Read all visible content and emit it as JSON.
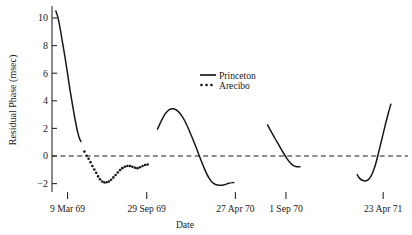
{
  "chart_data": {
    "type": "line",
    "title": "",
    "xlabel": "Date",
    "ylabel": "Residual Phase (msec)",
    "ylim": [
      -3.0,
      11.2
    ],
    "xlim": [
      0,
      100
    ],
    "grid": false,
    "legend_position": "upper-center-right",
    "y_ticks": [
      -2,
      0,
      2,
      4,
      6,
      8,
      10
    ],
    "y_tick_labels": [
      "−2",
      "0",
      "2",
      "4",
      "6",
      "8",
      "10"
    ],
    "x_ticks": [
      4.9,
      29.8,
      57.7,
      73.6,
      104.2
    ],
    "x_tick_labels": [
      "9 Mar 69",
      "29 Sep 69",
      "27 Apr 70",
      "1 Sep 70",
      "23 Apr 71"
    ],
    "zero_reference_line": {
      "value": 0,
      "style": "dashed"
    },
    "series": [
      {
        "name": "Princeton",
        "style": "solid",
        "segments": [
          {
            "comment": "segment 1 - steep fall from 10.5 to 1.0",
            "points": [
              [
                1.2,
                10.5
              ],
              [
                1.8,
                10.1
              ],
              [
                2.6,
                9.2
              ],
              [
                3.4,
                8.1
              ],
              [
                4.2,
                7.0
              ],
              [
                5.0,
                5.8
              ],
              [
                5.8,
                4.6
              ],
              [
                6.6,
                3.5
              ],
              [
                7.3,
                2.6
              ],
              [
                8.0,
                1.8
              ],
              [
                8.6,
                1.3
              ],
              [
                9.1,
                1.05
              ]
            ]
          },
          {
            "comment": "segment 2 - hump peaking at 3.4 then trough at -2.1",
            "points": [
              [
                33.2,
                1.95
              ],
              [
                34.4,
                2.55
              ],
              [
                35.6,
                3.05
              ],
              [
                36.8,
                3.35
              ],
              [
                38.2,
                3.42
              ],
              [
                39.6,
                3.25
              ],
              [
                41.0,
                2.85
              ],
              [
                42.4,
                2.25
              ],
              [
                43.8,
                1.5
              ],
              [
                45.2,
                0.7
              ],
              [
                46.6,
                -0.15
              ],
              [
                48.0,
                -0.95
              ],
              [
                49.4,
                -1.6
              ],
              [
                50.8,
                -1.98
              ],
              [
                52.4,
                -2.12
              ],
              [
                54.0,
                -2.1
              ],
              [
                55.6,
                -1.98
              ],
              [
                57.2,
                -1.92
              ]
            ]
          },
          {
            "comment": "segment 3 - descent from 2.2 crossing zero to -0.5",
            "points": [
              [
                67.8,
                2.25
              ],
              [
                69.0,
                1.75
              ],
              [
                70.2,
                1.25
              ],
              [
                71.4,
                0.78
              ],
              [
                72.6,
                0.3
              ],
              [
                73.8,
                -0.15
              ],
              [
                75.0,
                -0.5
              ],
              [
                76.0,
                -0.7
              ],
              [
                77.0,
                -0.78
              ],
              [
                78.0,
                -0.78
              ]
            ]
          },
          {
            "comment": "segment 4 - trough at -1.75 then steep rise to 3.8",
            "points": [
              [
                96.0,
                -1.35
              ],
              [
                96.8,
                -1.62
              ],
              [
                97.8,
                -1.78
              ],
              [
                98.8,
                -1.8
              ],
              [
                99.8,
                -1.65
              ],
              [
                100.8,
                -1.25
              ],
              [
                101.8,
                -0.6
              ],
              [
                102.8,
                0.3
              ],
              [
                103.8,
                1.25
              ],
              [
                104.8,
                2.2
              ],
              [
                105.8,
                3.1
              ],
              [
                106.6,
                3.75
              ]
            ]
          }
        ]
      },
      {
        "name": "Arecibo",
        "style": "dotted",
        "points": [
          [
            10.2,
            0.32
          ],
          [
            10.9,
            0.02
          ],
          [
            11.5,
            -0.2
          ],
          [
            12.1,
            -0.45
          ],
          [
            12.7,
            -0.72
          ],
          [
            13.3,
            -0.98
          ],
          [
            13.9,
            -1.22
          ],
          [
            14.5,
            -1.48
          ],
          [
            15.1,
            -1.68
          ],
          [
            15.8,
            -1.85
          ],
          [
            16.5,
            -1.92
          ],
          [
            17.2,
            -1.9
          ],
          [
            17.9,
            -1.85
          ],
          [
            18.6,
            -1.72
          ],
          [
            19.3,
            -1.55
          ],
          [
            20.0,
            -1.38
          ],
          [
            20.7,
            -1.2
          ],
          [
            21.4,
            -1.02
          ],
          [
            22.1,
            -0.88
          ],
          [
            22.9,
            -0.78
          ],
          [
            23.7,
            -0.72
          ],
          [
            24.5,
            -0.72
          ],
          [
            25.3,
            -0.78
          ],
          [
            26.1,
            -0.85
          ],
          [
            26.9,
            -0.88
          ],
          [
            27.7,
            -0.82
          ],
          [
            28.5,
            -0.72
          ],
          [
            29.3,
            -0.65
          ],
          [
            30.1,
            -0.62
          ]
        ]
      }
    ]
  },
  "legend": {
    "entries": [
      {
        "label": "Princeton",
        "marker": "solid-line"
      },
      {
        "label": "Arecibo",
        "marker": "dotted-line"
      }
    ]
  }
}
